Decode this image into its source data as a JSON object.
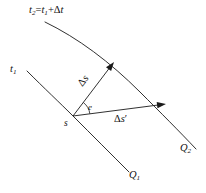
{
  "figure": {
    "kind": "geometry-diagram",
    "width": 206,
    "height": 193,
    "background_color": "#ffffff",
    "stroke_color": "#1a1a1a",
    "labels": {
      "upper_curve_time": {
        "t_symbol": "t",
        "t_subscript": "2",
        "equals": "=",
        "t1_symbol": "t",
        "t1_subscript": "1",
        "plus": "+",
        "delta": "Δ",
        "delta_var": "t"
      },
      "lower_curve_time": {
        "t_symbol": "t",
        "t_subscript": "1"
      },
      "displacement_ds": {
        "delta": "Δ",
        "var": "s"
      },
      "angle": "e",
      "event_point": "s",
      "displacement_ds_prime": {
        "delta": "Δ",
        "var": "s",
        "prime": "′"
      },
      "curve_q2": {
        "symbol": "Q",
        "subscript": "2"
      },
      "curve_q1": {
        "symbol": "Q",
        "subscript": "1"
      }
    }
  },
  "chart_data": {
    "type": "scatter",
    "title": "",
    "xlabel": "",
    "ylabel": "",
    "grid": false,
    "legend_position": "none",
    "xlim": [
      0,
      206
    ],
    "ylim": [
      0,
      193
    ],
    "curves": [
      {
        "name": "t2 = t1 + Δt simultaneity curve",
        "label": "t₂ = t₁ + Δt",
        "path": "M 45,22 C 78,38 110,62 140,92 C 160,112 180,132 196,149",
        "endpoint_label": "Q₂"
      },
      {
        "name": "t1 simultaneity curve",
        "label": "t₁",
        "path": "M 27,71 C 44,88 60,103 73,116 C 92,135 112,155 129,172",
        "endpoint_label": "Q₁"
      }
    ],
    "vectors": [
      {
        "name": "Δs",
        "from": [
          73,
          116
        ],
        "to": [
          114,
          62
        ],
        "arrowhead": true,
        "label": "Δs"
      },
      {
        "name": "Δs′",
        "from": [
          73,
          116
        ],
        "to": [
          166,
          104
        ],
        "arrowhead": true,
        "label": "Δs′"
      }
    ],
    "angle_marks": [
      {
        "name": "e",
        "vertex": [
          73,
          116
        ],
        "label": "e",
        "between": [
          "Δs",
          "Δs′"
        ]
      }
    ],
    "points": [
      {
        "name": "s",
        "at": [
          73,
          116
        ],
        "label": "s"
      }
    ]
  }
}
